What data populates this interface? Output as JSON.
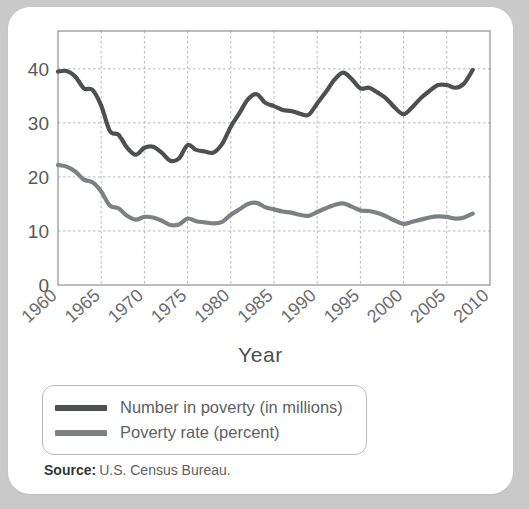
{
  "figure": {
    "axis_title_x": "Year",
    "source_label": "Source:",
    "source_value": "U.S. Census Bureau."
  },
  "legend": {
    "items": [
      {
        "label": "Number in poverty (in millions)",
        "color": "#4d4f51"
      },
      {
        "label": "Poverty rate (percent)",
        "color": "#7e8183"
      }
    ]
  },
  "colors": {
    "page_background": "#c9c9c9",
    "card_background": "#ffffff",
    "grid": "#b4b6b8",
    "frame": "#8e9092",
    "tick_text": "#56585a",
    "series_number": "#4d4f51",
    "series_rate": "#7e8183"
  },
  "chart_data": {
    "type": "line",
    "title": "",
    "xlabel": "Year",
    "ylabel": "",
    "xlim": [
      1960,
      2010
    ],
    "ylim": [
      0,
      47
    ],
    "yticks": [
      0,
      10,
      20,
      30,
      40
    ],
    "ytick_labels": [
      "0",
      "10",
      "20",
      "30",
      "40"
    ],
    "xticks": [
      1960,
      1965,
      1970,
      1975,
      1980,
      1985,
      1990,
      1995,
      2000,
      2005,
      2010
    ],
    "xtick_labels": [
      "1960",
      "1965",
      "1970",
      "1975",
      "1980",
      "1985",
      "1990",
      "1995",
      "2000",
      "2005",
      "2010"
    ],
    "grid": true,
    "legend_position": "below-plot",
    "x": [
      1960,
      1961,
      1962,
      1963,
      1964,
      1965,
      1966,
      1967,
      1968,
      1969,
      1970,
      1971,
      1972,
      1973,
      1974,
      1975,
      1976,
      1977,
      1978,
      1979,
      1980,
      1981,
      1982,
      1983,
      1984,
      1985,
      1986,
      1987,
      1988,
      1989,
      1990,
      1991,
      1992,
      1993,
      1994,
      1995,
      1996,
      1997,
      1998,
      1999,
      2000,
      2001,
      2002,
      2003,
      2004,
      2005,
      2006,
      2007,
      2008
    ],
    "series": [
      {
        "name": "Number in poverty (in millions)",
        "color": "#4d4f51",
        "values": [
          39.5,
          39.6,
          38.6,
          36.4,
          36.1,
          33.2,
          28.5,
          27.8,
          25.4,
          24.1,
          25.4,
          25.6,
          24.5,
          23.0,
          23.4,
          25.9,
          25.0,
          24.7,
          24.5,
          26.1,
          29.3,
          31.8,
          34.4,
          35.3,
          33.7,
          33.1,
          32.4,
          32.2,
          31.7,
          31.5,
          33.6,
          35.7,
          38.0,
          39.3,
          38.1,
          36.4,
          36.5,
          35.6,
          34.5,
          32.8,
          31.6,
          32.9,
          34.6,
          35.9,
          37.0,
          37.0,
          36.5,
          37.3,
          39.8
        ]
      },
      {
        "name": "Poverty rate (percent)",
        "color": "#7e8183",
        "values": [
          22.2,
          21.9,
          21.0,
          19.5,
          19.0,
          17.3,
          14.7,
          14.2,
          12.8,
          12.1,
          12.6,
          12.5,
          11.9,
          11.1,
          11.2,
          12.3,
          11.8,
          11.6,
          11.4,
          11.7,
          13.0,
          14.0,
          15.0,
          15.2,
          14.4,
          14.0,
          13.6,
          13.4,
          13.0,
          12.8,
          13.5,
          14.2,
          14.8,
          15.1,
          14.5,
          13.8,
          13.7,
          13.3,
          12.7,
          11.9,
          11.3,
          11.7,
          12.1,
          12.5,
          12.7,
          12.6,
          12.3,
          12.5,
          13.2
        ]
      }
    ]
  }
}
